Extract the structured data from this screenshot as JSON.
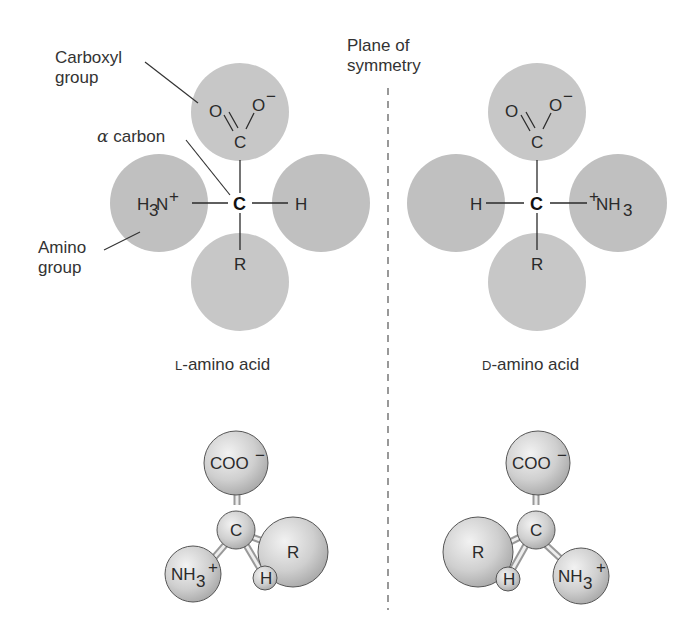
{
  "labels": {
    "carboxyl_line1": "Carboxyl",
    "carboxyl_line2": "group",
    "alpha_symbol": "α",
    "alpha_text": " carbon",
    "amino_line1": "Amino",
    "amino_line2": "group",
    "plane_line1": "Plane of",
    "plane_line2": "symmetry",
    "l_prefix": "L",
    "l_suffix": "-amino acid",
    "d_prefix": "D",
    "d_suffix": "-amino acid"
  },
  "left_molecule": {
    "top_O1": "O",
    "top_O2": "O",
    "top_O2_charge": "−",
    "top_C": "C",
    "center": "C",
    "left_group": "H",
    "left_sub": "3",
    "left_N": "N",
    "left_charge": "+",
    "right_group": "H",
    "bottom_group": "R"
  },
  "right_molecule": {
    "top_O1": "O",
    "top_O2": "O",
    "top_O2_charge": "−",
    "top_C": "C",
    "center": "C",
    "left_group": "H",
    "right_charge": "+",
    "right_N": "NH",
    "right_sub": "3",
    "bottom_group": "R"
  },
  "left_ball_stick": {
    "top": "COO",
    "top_charge": "−",
    "center": "C",
    "amino": "NH",
    "amino_sub": "3",
    "amino_charge": "+",
    "h": "H",
    "r": "R"
  },
  "right_ball_stick": {
    "top": "COO",
    "top_charge": "−",
    "center": "C",
    "amino": "NH",
    "amino_sub": "3",
    "amino_charge": "+",
    "h": "H",
    "r": "R"
  },
  "colors": {
    "sphere_fill": "#c8c8c8",
    "ball_fill": "#d6d6d6",
    "line": "#2a2a2a"
  }
}
